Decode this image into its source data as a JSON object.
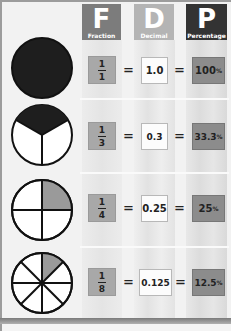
{
  "header": {
    "columns": [
      {
        "letter": "F",
        "label": "Fraction"
      },
      {
        "letter": "D",
        "label": "Decimal"
      },
      {
        "letter": "P",
        "label": "Percentage"
      }
    ]
  },
  "rows": [
    {
      "pie": "whole-circle",
      "numerator": "1",
      "denominator": "1",
      "equals": "=",
      "decimal": "1.0",
      "percent_value": "100",
      "percent_sign": "%"
    },
    {
      "pie": "thirds-one-shaded",
      "numerator": "1",
      "denominator": "3",
      "equals": "=",
      "decimal": "0.3̇",
      "percent_value": "33.3̇",
      "percent_sign": "%"
    },
    {
      "pie": "quarters-one-shaded",
      "numerator": "1",
      "denominator": "4",
      "equals": "=",
      "decimal": "0.25",
      "percent_value": "25",
      "percent_sign": "%"
    },
    {
      "pie": "eighths-one-shaded",
      "numerator": "1",
      "denominator": "8",
      "equals": "=",
      "decimal": "0.125",
      "percent_value": "12.5",
      "percent_sign": "%"
    }
  ],
  "colors": {
    "fraction_header": "#7c7c7c",
    "decimal_header": "#b4b4b4",
    "percentage_header": "#333333",
    "fraction_cell": "#a8a8a8",
    "decimal_cell": "#fcfcfc",
    "percentage_cell": "#8c8c8c",
    "pie_shaded_full": "#1e1e1e",
    "pie_shaded_partial": "#9a9a9a"
  }
}
